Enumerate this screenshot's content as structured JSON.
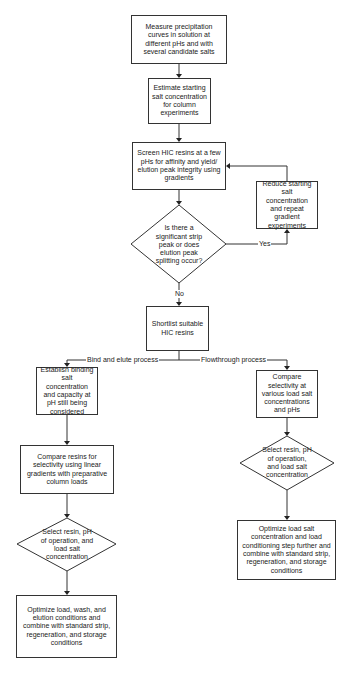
{
  "diagram": {
    "type": "flowchart",
    "nodes": [
      {
        "id": "measure",
        "shape": "box",
        "label": "Measure precipitation curves in solution at different pHs and with several candidate salts"
      },
      {
        "id": "estimate",
        "shape": "box",
        "label": "Estimate starting salt concentration for column experiments"
      },
      {
        "id": "screen",
        "shape": "box",
        "label": "Screen HIC resins at a few pHs for affinity and yield/ elution peak integrity using gradients"
      },
      {
        "id": "decision_strip",
        "shape": "diamond",
        "label": "Is there a significant strip peak or does elution peak splitting occur?"
      },
      {
        "id": "reduce",
        "shape": "box",
        "label": "Reduce starting salt concentration and repeat gradient experiments"
      },
      {
        "id": "shortlist",
        "shape": "box",
        "label": "Shortlist suitable HIC resins"
      },
      {
        "id": "establish",
        "shape": "box",
        "label": "Establish binding salt concentration and capacity at pH still being considered"
      },
      {
        "id": "compare_resins",
        "shape": "box",
        "label": "Compare resins for selectivity using linear gradients with preparative column loads"
      },
      {
        "id": "select_left",
        "shape": "diamond",
        "label": "Select resin, pH of operation, and load salt concentration"
      },
      {
        "id": "optimize_left",
        "shape": "box",
        "label": "Optimize load, wash, and elution conditions and combine with standard strip, regeneration, and storage conditions"
      },
      {
        "id": "compare_selectivity",
        "shape": "box",
        "label": "Compare selectivity at various load salt concentrations and pHs"
      },
      {
        "id": "select_right",
        "shape": "diamond",
        "label": "Select resin, pH of operation, and load salt concentration"
      },
      {
        "id": "optimize_right",
        "shape": "box",
        "label": "Optimize load salt concentration and load conditioning step further and combine with standard strip, regeneration, and storage conditions"
      }
    ],
    "edge_labels": {
      "yes": "Yes",
      "no": "No",
      "bind_elute": "Bind and elute process",
      "flowthrough": "Flowthrough process"
    },
    "edges": [
      {
        "from": "measure",
        "to": "estimate"
      },
      {
        "from": "estimate",
        "to": "screen"
      },
      {
        "from": "screen",
        "to": "decision_strip"
      },
      {
        "from": "decision_strip",
        "to": "reduce",
        "label": "Yes"
      },
      {
        "from": "reduce",
        "to": "screen"
      },
      {
        "from": "decision_strip",
        "to": "shortlist",
        "label": "No"
      },
      {
        "from": "shortlist",
        "to": "establish",
        "label": "Bind and elute process"
      },
      {
        "from": "shortlist",
        "to": "compare_selectivity",
        "label": "Flowthrough process"
      },
      {
        "from": "establish",
        "to": "compare_resins"
      },
      {
        "from": "compare_resins",
        "to": "select_left"
      },
      {
        "from": "select_left",
        "to": "optimize_left"
      },
      {
        "from": "compare_selectivity",
        "to": "select_right"
      },
      {
        "from": "select_right",
        "to": "optimize_right"
      }
    ]
  }
}
